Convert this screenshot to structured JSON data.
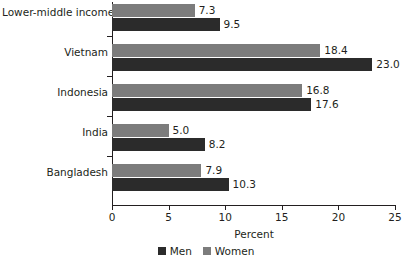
{
  "chart_data": {
    "type": "bar",
    "orientation": "horizontal",
    "title": "",
    "subtitle": "",
    "xlabel": "Percent",
    "ylabel": "",
    "xlim": [
      0,
      25
    ],
    "xticks": [
      0,
      5,
      10,
      15,
      20,
      25
    ],
    "xtick_labels": [
      "0",
      "5",
      "10",
      "15",
      "20",
      "25"
    ],
    "grid": false,
    "legend_position": "bottom-center",
    "categories": [
      "Lower-middle income",
      "Vietnam",
      "Indonesia",
      "India",
      "Bangladesh"
    ],
    "series": [
      {
        "name": "Men",
        "color": "#2b2b2b",
        "values": [
          9.5,
          23.0,
          17.6,
          8.2,
          10.3
        ],
        "value_labels": [
          "9.5",
          "23.0",
          "17.6",
          "8.2",
          "10.3"
        ]
      },
      {
        "name": "Women",
        "color": "#7c7c7c",
        "values": [
          7.3,
          18.4,
          16.8,
          5.0,
          7.9
        ],
        "value_labels": [
          "7.3",
          "18.4",
          "16.8",
          "5.0",
          "7.9"
        ]
      }
    ]
  },
  "legend": {
    "items": [
      {
        "label": "Men",
        "color": "#2b2b2b"
      },
      {
        "label": "Women",
        "color": "#7c7c7c"
      }
    ]
  },
  "axis": {
    "x_title": "Percent"
  }
}
